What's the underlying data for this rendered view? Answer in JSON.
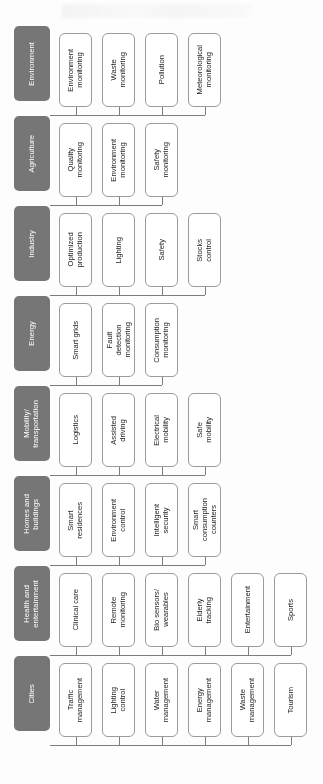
{
  "diagram": {
    "orientation": "rotated-90",
    "colors": {
      "header_background": "#767676",
      "header_text": "#ffffff",
      "node_background": "#ffffff",
      "node_border": "#9b9b9b",
      "node_text": "#1d1d1d",
      "connector_line": "#7d7d7d",
      "page_background": "#fdfdfd"
    },
    "categories": [
      {
        "label": "Environment",
        "children": [
          "Environment\nmonitoring",
          "Waste\nmonitoring",
          "Pollution",
          "Meteorological\nmonitoring"
        ]
      },
      {
        "label": "Agriculture",
        "children": [
          "Quality\nmonitoring",
          "Environment\nmonitoring",
          "Safety\nmonitoring"
        ]
      },
      {
        "label": "Industry",
        "children": [
          "Optimized\nproduction",
          "Lighting",
          "Safety",
          "Stocks\ncontrol"
        ]
      },
      {
        "label": "Energy",
        "children": [
          "Smart grids",
          "Fault\ndetection\nmonitoring",
          "Consumption\nmonitoring"
        ]
      },
      {
        "label": "Mobility/\ntransportation",
        "children": [
          "Logistics",
          "Assisted\ndriving",
          "Electrical\nmobility",
          "Safe\nmobility"
        ]
      },
      {
        "label": "Homes and\nbuildings",
        "children": [
          "Smart\nresidences",
          "Environment\ncontrol",
          "Intelligent\nsecurity",
          "Smart\nconsumption\ncounters"
        ]
      },
      {
        "label": "Health and\nentertainment",
        "children": [
          "Clinical care",
          "Remote\nmonitoring",
          "Bio sensors/\nwearables",
          "Elderly\ntracking",
          "Entertainment",
          "Sports"
        ]
      },
      {
        "label": "Cities",
        "children": [
          "Traffic\nmanagement",
          "Lighting\ncontrol",
          "Water\nmanagement",
          "Energy\nmanagement",
          "Waste\nmanagement",
          "Tourism"
        ]
      }
    ]
  }
}
